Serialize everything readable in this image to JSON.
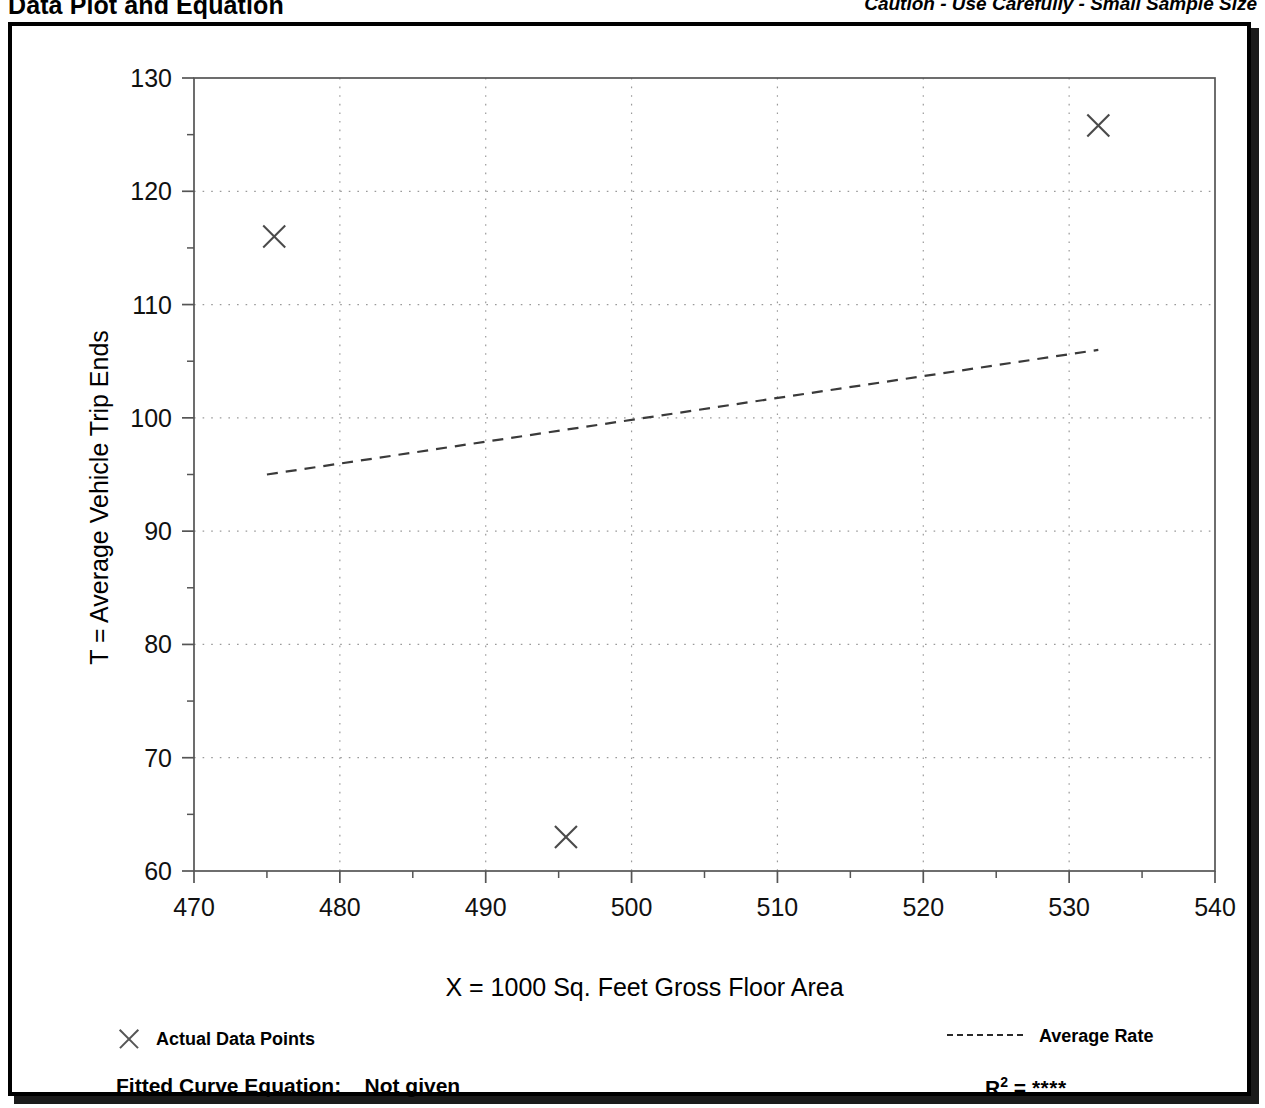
{
  "header": {
    "title": "Data Plot and Equation",
    "caution": "Caution - Use Carefully - Small Sample Size"
  },
  "legend": {
    "data_points_label": "Actual Data Points",
    "average_rate_label": "Average Rate",
    "marker_icon": "x-marker-icon",
    "line_icon": "dashed-line-icon"
  },
  "footer": {
    "equation_label": "Fitted Curve Equation:",
    "equation_value": "Not given",
    "rsq_symbol": "R",
    "rsq_exponent": "2",
    "rsq_equals": "=",
    "rsq_value": "****"
  },
  "colors": {
    "axis": "#555555",
    "grid": "#9a9a9a",
    "marker": "#4a4a4a",
    "trendline": "#3a3a3a",
    "frame": "#000000",
    "background": "#ffffff"
  },
  "chart_data": {
    "type": "scatter",
    "title": "Data Plot and Equation",
    "xlabel": "X = 1000 Sq. Feet Gross Floor Area",
    "ylabel": "T = Average Vehicle Trip Ends",
    "xlim": [
      470,
      540
    ],
    "ylim": [
      60,
      130
    ],
    "xticks": [
      470,
      480,
      490,
      500,
      510,
      520,
      530,
      540
    ],
    "yticks": [
      60,
      70,
      80,
      90,
      100,
      110,
      120,
      130
    ],
    "xticklabels": [
      "470",
      "480",
      "490",
      "500",
      "510",
      "520",
      "530",
      "540"
    ],
    "yticklabels": [
      "60",
      "70",
      "80",
      "90",
      "100",
      "110",
      "120",
      "130"
    ],
    "x_minor_ticks": [
      475,
      485,
      495,
      505,
      515,
      525,
      535
    ],
    "y_minor_ticks": [
      65,
      75,
      85,
      95,
      105,
      115,
      125
    ],
    "grid": true,
    "grid_style": "dotted",
    "legend_position": "below-plot",
    "series": [
      {
        "name": "Actual Data Points",
        "type": "scatter",
        "marker": "x",
        "points": [
          {
            "x": 475.5,
            "y": 116.0
          },
          {
            "x": 495.5,
            "y": 63.0
          },
          {
            "x": 532.0,
            "y": 125.8
          }
        ]
      },
      {
        "name": "Average Rate",
        "type": "line",
        "linestyle": "dashed",
        "points": [
          {
            "x": 475.0,
            "y": 95.0
          },
          {
            "x": 532.0,
            "y": 106.0
          }
        ]
      }
    ],
    "annotations": [
      "Caution - Use Carefully - Small Sample Size",
      "Fitted Curve Equation: Not given",
      "R2 = ****"
    ]
  }
}
